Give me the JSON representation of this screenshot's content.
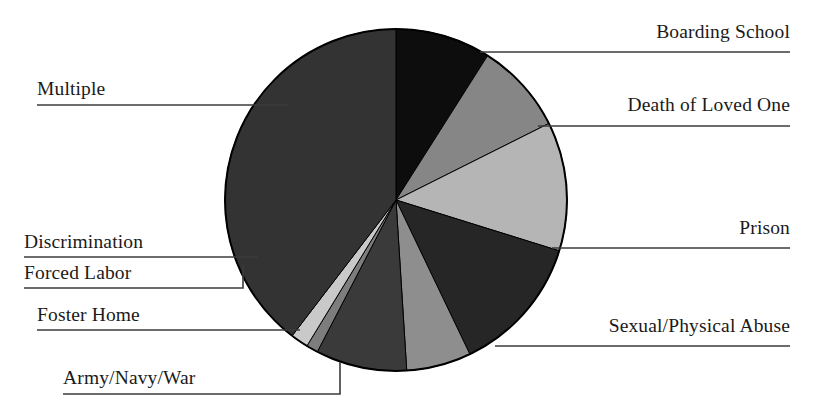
{
  "chart_data": {
    "type": "pie",
    "title": "",
    "xlabel": "",
    "ylabel": "",
    "legend_position": "callout-labels",
    "grid": false,
    "start_angle_deg": 0,
    "direction": "clockwise",
    "center": {
      "x": 396,
      "y": 200
    },
    "radius": 171,
    "categories": [
      "Boarding School",
      "Death of Loved One",
      "Prison",
      "Sexual/Physical Abuse",
      "Army/Navy/War",
      "Foster Home",
      "Forced Labor",
      "Discrimination",
      "Multiple"
    ],
    "values": [
      9.0,
      8.6,
      12.2,
      13.1,
      6.1,
      8.6,
      1.1,
      1.7,
      39.6
    ],
    "slices": [
      {
        "label": "Boarding School",
        "value": 9.0,
        "color": "#0d0d0d",
        "start_deg": 0.0,
        "end_deg": 32.4
      },
      {
        "label": "Death of Loved One",
        "value": 8.6,
        "color": "#868686",
        "start_deg": 32.4,
        "end_deg": 63.4
      },
      {
        "label": "Prison",
        "value": 12.2,
        "color": "#b5b5b5",
        "start_deg": 63.4,
        "end_deg": 107.3
      },
      {
        "label": "Sexual/Physical Abuse",
        "value": 13.1,
        "color": "#262626",
        "start_deg": 107.3,
        "end_deg": 154.4
      },
      {
        "label": "Army/Navy/War",
        "value": 6.1,
        "color": "#8e8e8e",
        "start_deg": 154.4,
        "end_deg": 176.4
      },
      {
        "label": "Foster Home",
        "value": 8.6,
        "color": "#3a3a3a",
        "start_deg": 176.4,
        "end_deg": 207.4
      },
      {
        "label": "Forced Labor",
        "value": 1.1,
        "color": "#7d7d7d",
        "start_deg": 207.4,
        "end_deg": 211.4
      },
      {
        "label": "Discrimination",
        "value": 1.7,
        "color": "#c9c9c9",
        "start_deg": 211.4,
        "end_deg": 217.4
      },
      {
        "label": "Multiple",
        "value": 39.6,
        "color": "#333333",
        "start_deg": 217.4,
        "end_deg": 360.0
      }
    ]
  },
  "labels": {
    "boarding_school": "Boarding School",
    "death_of_loved_one": "Death of Loved One",
    "prison": "Prison",
    "sexual_physical_abuse": "Sexual/Physical Abuse",
    "army_navy_war": "Army/Navy/War",
    "foster_home": "Foster Home",
    "forced_labor": "Forced Labor",
    "discrimination": "Discrimination",
    "multiple": "Multiple"
  },
  "style": {
    "background": "#ffffff",
    "outline": "#000000",
    "leader_line": "#3b3b3b",
    "text": "#1a1a1a"
  }
}
